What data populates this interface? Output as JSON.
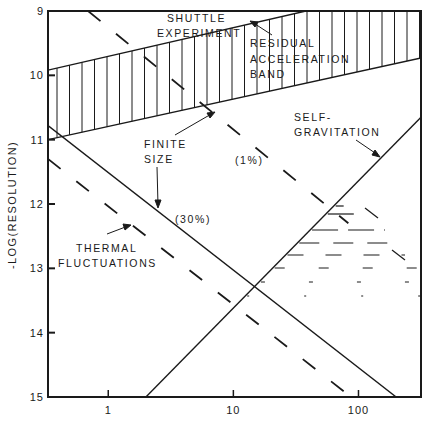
{
  "chart_data": {
    "type": "line",
    "title": "",
    "xlabel": "",
    "ylabel": "-LOG(RESOLUTION)",
    "x_scale": "log",
    "xlim": [
      0.33,
      316
    ],
    "ylim": [
      15,
      9
    ],
    "y_inverted": true,
    "x_ticks": [
      {
        "value": 1,
        "label": "1"
      },
      {
        "value": 10,
        "label": "10"
      },
      {
        "value": 100,
        "label": "100"
      }
    ],
    "y_ticks": [
      {
        "value": 9,
        "label": "9"
      },
      {
        "value": 10,
        "label": "10"
      },
      {
        "value": 11,
        "label": "11"
      },
      {
        "value": 12,
        "label": "12"
      },
      {
        "value": 13,
        "label": "13"
      },
      {
        "value": 14,
        "label": "14"
      },
      {
        "value": 15,
        "label": "15"
      }
    ],
    "grid": false,
    "color": "#1a1a1a",
    "series": [
      {
        "name": "Residual acceleration band (upper)",
        "style": "solid",
        "x": [
          0.33,
          38
        ],
        "y": [
          9.92,
          9.0
        ]
      },
      {
        "name": "Residual acceleration band (lower)",
        "style": "solid",
        "x": [
          0.33,
          316
        ],
        "y": [
          11.0,
          9.73
        ]
      },
      {
        "name": "Finite size (30%)",
        "style": "solid",
        "x": [
          0.33,
          200
        ],
        "y": [
          10.78,
          15.0
        ]
      },
      {
        "name": "Self-gravitation",
        "style": "solid",
        "x": [
          2.0,
          316
        ],
        "y": [
          15.0,
          10.65
        ]
      },
      {
        "name": "Thermal fluctuations",
        "style": "dashed",
        "x": [
          0.33,
          87
        ],
        "y": [
          11.3,
          15.0
        ]
      },
      {
        "name": "Finite size (1%)",
        "style": "dashed",
        "x": [
          0.69,
          83
        ],
        "y": [
          9.0,
          12.3
        ]
      }
    ],
    "regions": [
      {
        "name": "Shuttle experiment residual acceleration band",
        "fill": "vertical-hatch"
      },
      {
        "name": "Self-gravitation region",
        "fill": "horizontal-dash-hatch"
      }
    ],
    "annotations": [
      {
        "id": "shuttle",
        "lines": [
          "SHUTTLE",
          "EXPERIMENT"
        ]
      },
      {
        "id": "residual",
        "lines": [
          "RESIDUAL",
          "ACCELERATION",
          "BAND"
        ]
      },
      {
        "id": "selfgrav",
        "lines": [
          "SELF-",
          "GRAVITATION"
        ]
      },
      {
        "id": "finite",
        "lines": [
          "FINITE",
          "SIZE"
        ]
      },
      {
        "id": "pct1",
        "lines": [
          "(1%)"
        ]
      },
      {
        "id": "pct30",
        "lines": [
          "(30%)"
        ]
      },
      {
        "id": "thermal",
        "lines": [
          "THERMAL",
          "FLUCTUATIONS"
        ]
      }
    ]
  }
}
